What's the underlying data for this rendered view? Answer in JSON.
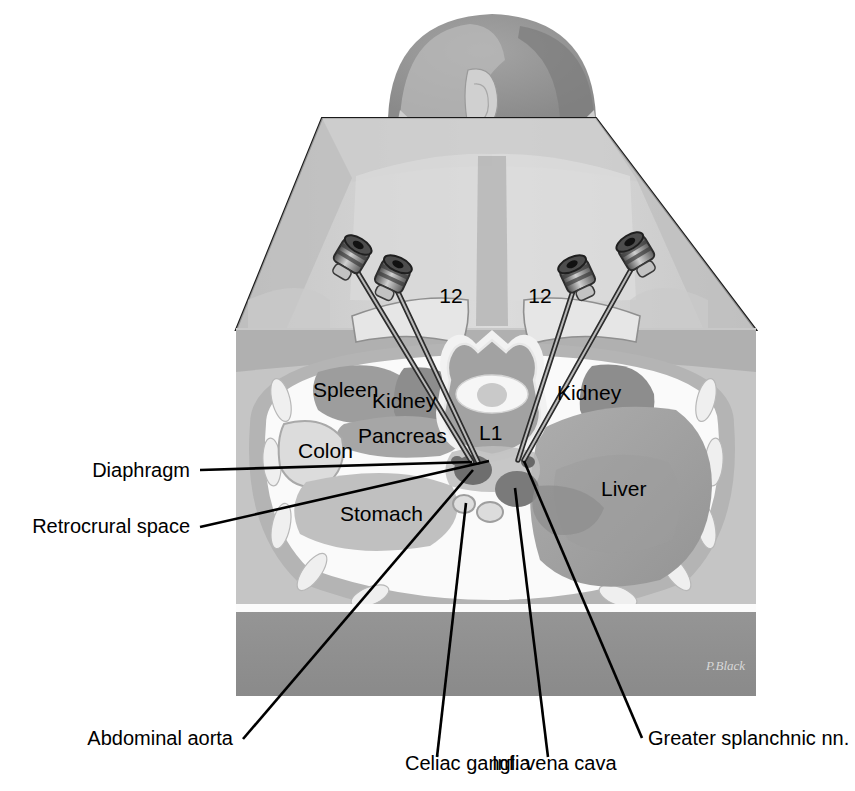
{
  "figure": {
    "signature": "P.Black"
  },
  "organ_labels": [
    {
      "id": "spleen",
      "text": "Spleen",
      "x": 313,
      "y": 397,
      "anchor": "start"
    },
    {
      "id": "kidney_l",
      "text": "Kidney",
      "x": 372,
      "y": 408,
      "anchor": "start"
    },
    {
      "id": "kidney_r",
      "text": "Kidney",
      "x": 557,
      "y": 400,
      "anchor": "start"
    },
    {
      "id": "colon",
      "text": "Colon",
      "x": 298,
      "y": 458,
      "anchor": "start"
    },
    {
      "id": "pancreas",
      "text": "Pancreas",
      "x": 358,
      "y": 443,
      "anchor": "start"
    },
    {
      "id": "stomach",
      "text": "Stomach",
      "x": 340,
      "y": 521,
      "anchor": "start"
    },
    {
      "id": "liver",
      "text": "Liver",
      "x": 601,
      "y": 496,
      "anchor": "start"
    },
    {
      "id": "l1",
      "text": "L1",
      "x": 479,
      "y": 440,
      "anchor": "start"
    }
  ],
  "rib_labels": [
    {
      "id": "rib12_left",
      "text": "12",
      "x": 451,
      "y": 303
    },
    {
      "id": "rib12_right",
      "text": "12",
      "x": 540,
      "y": 303
    }
  ],
  "callouts": [
    {
      "id": "diaphragm",
      "text": "Diaphragm",
      "text_x": 190,
      "text_y": 477,
      "anchor": "end",
      "leader": "M200,470 L472,462"
    },
    {
      "id": "retrocrural-space",
      "text": "Retrocrural space",
      "text_x": 190,
      "text_y": 533,
      "anchor": "end",
      "leader": "M200,527 L489,461"
    },
    {
      "id": "abdominal-aorta",
      "text": "Abdominal aorta",
      "text_x": 233,
      "text_y": 745,
      "anchor": "end",
      "leader": "M243,739 L473,470"
    },
    {
      "id": "celiac-ganglia",
      "text": "Celiac ganglia",
      "text_x": 405,
      "text_y": 770,
      "anchor": "start",
      "leader": "M437,757 L466,503"
    },
    {
      "id": "inf-vena-cava",
      "text": "Inf. vena cava",
      "text_x": 492,
      "text_y": 770,
      "anchor": "start",
      "leader": "M548,757 L515,488"
    },
    {
      "id": "greater-splanchnic-nn",
      "text": "Greater splanchnic nn.",
      "text_x": 648,
      "text_y": 745,
      "anchor": "start",
      "leader": "M642,738 L524,461"
    }
  ],
  "colors": {
    "background": "#ffffff",
    "outline": "#000000",
    "skin_light": "#e3e3e3",
    "skin_mid": "#cfcfcf",
    "muscle": "#b4b4b4",
    "muscle_dark": "#9a9a9a",
    "hair_dark": "#8e8e8e",
    "table": "#8f8f8f",
    "fat_white": "#fbfbfb",
    "organ_gray": "#a8a8a8",
    "organ_dark": "#8a8a8a",
    "vessel_dark": "#6f6f6f",
    "bone_light": "#ededed",
    "needle_metal": "#6b6b6b"
  },
  "needles": [
    {
      "id": "needle-left-outer",
      "hub_x": 351,
      "hub_y": 257,
      "tip_x": 472,
      "tip_y": 462
    },
    {
      "id": "needle-left-inner",
      "hub_x": 392,
      "hub_y": 277,
      "tip_x": 478,
      "tip_y": 462
    },
    {
      "id": "needle-right-inner",
      "hub_x": 578,
      "hub_y": 277,
      "tip_x": 518,
      "tip_y": 460
    },
    {
      "id": "needle-right-outer",
      "hub_x": 637,
      "hub_y": 254,
      "tip_x": 524,
      "tip_y": 460
    }
  ]
}
